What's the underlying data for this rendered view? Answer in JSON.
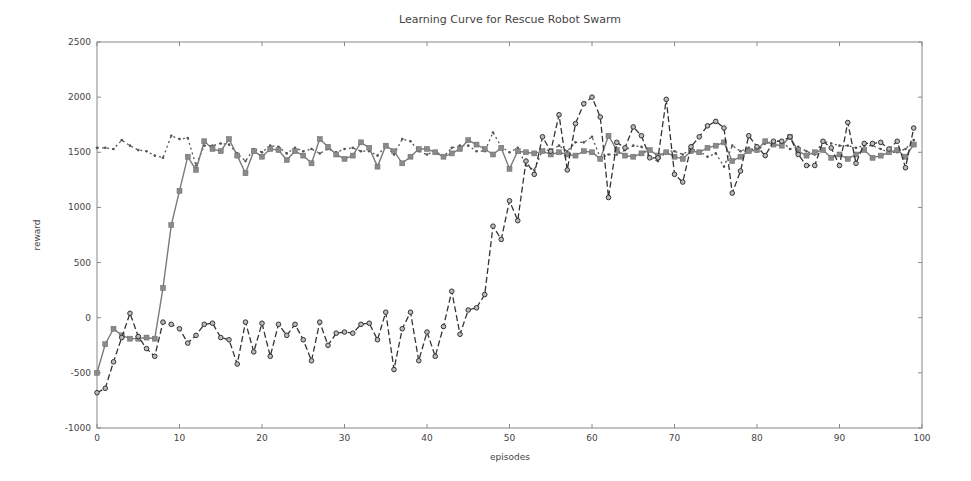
{
  "chart_data": {
    "type": "line",
    "title": "Learning Curve for Rescue Robot Swarm",
    "xlabel": "episodes",
    "ylabel": "reward",
    "xlim": [
      0,
      100
    ],
    "ylim": [
      -1000,
      2500
    ],
    "xticks": [
      0,
      10,
      20,
      30,
      40,
      50,
      60,
      70,
      80,
      90,
      100
    ],
    "yticks": [
      -1000,
      -500,
      0,
      500,
      1000,
      1500,
      2000,
      2500
    ],
    "grid": false,
    "legend": null,
    "x": [
      0,
      1,
      2,
      3,
      4,
      5,
      6,
      7,
      8,
      9,
      10,
      11,
      12,
      13,
      14,
      15,
      16,
      17,
      18,
      19,
      20,
      21,
      22,
      23,
      24,
      25,
      26,
      27,
      28,
      29,
      30,
      31,
      32,
      33,
      34,
      35,
      36,
      37,
      38,
      39,
      40,
      41,
      42,
      43,
      44,
      45,
      46,
      47,
      48,
      49,
      50,
      51,
      52,
      53,
      54,
      55,
      56,
      57,
      58,
      59,
      60,
      61,
      62,
      63,
      64,
      65,
      66,
      67,
      68,
      69,
      70,
      71,
      72,
      73,
      74,
      75,
      76,
      77,
      78,
      79,
      80,
      81,
      82,
      83,
      84,
      85,
      86,
      87,
      88,
      89,
      90,
      91,
      92,
      93,
      94,
      95,
      96,
      97,
      98,
      99
    ],
    "series": [
      {
        "name": "series-squares-solid",
        "style": "solid",
        "marker": "square",
        "color": "#7a7a7a",
        "values": [
          -500,
          -240,
          -100,
          -160,
          -190,
          -190,
          -180,
          -190,
          270,
          840,
          1150,
          1460,
          1340,
          1600,
          1530,
          1510,
          1620,
          1470,
          1310,
          1510,
          1460,
          1530,
          1520,
          1430,
          1510,
          1470,
          1400,
          1620,
          1550,
          1480,
          1440,
          1470,
          1590,
          1540,
          1370,
          1560,
          1510,
          1400,
          1460,
          1530,
          1530,
          1500,
          1460,
          1490,
          1530,
          1610,
          1570,
          1530,
          1480,
          1540,
          1350,
          1510,
          1500,
          1490,
          1510,
          1480,
          1500,
          1480,
          1470,
          1510,
          1500,
          1440,
          1650,
          1520,
          1470,
          1460,
          1490,
          1520,
          1470,
          1500,
          1460,
          1440,
          1510,
          1500,
          1540,
          1560,
          1590,
          1420,
          1460,
          1510,
          1520,
          1600,
          1570,
          1560,
          1640,
          1510,
          1470,
          1500,
          1520,
          1450,
          1480,
          1440,
          1480,
          1520,
          1450,
          1470,
          1500,
          1520,
          1460,
          1570
        ]
      },
      {
        "name": "series-circles-dashed",
        "style": "dashed",
        "marker": "circle",
        "color": "#333333",
        "values": [
          -680,
          -640,
          -400,
          -180,
          40,
          -170,
          -280,
          -350,
          -40,
          -60,
          -100,
          -230,
          -160,
          -60,
          -50,
          -180,
          -200,
          -420,
          -40,
          -310,
          -50,
          -350,
          -60,
          -160,
          -60,
          -200,
          -390,
          -40,
          -250,
          -140,
          -130,
          -140,
          -60,
          -50,
          -200,
          50,
          -470,
          -100,
          50,
          -390,
          -130,
          -350,
          -80,
          240,
          -150,
          70,
          90,
          210,
          830,
          710,
          1060,
          880,
          1420,
          1300,
          1640,
          1510,
          1840,
          1340,
          1760,
          1940,
          2000,
          1820,
          1090,
          1590,
          1540,
          1730,
          1650,
          1450,
          1450,
          1980,
          1300,
          1230,
          1550,
          1640,
          1740,
          1780,
          1720,
          1130,
          1330,
          1650,
          1550,
          1470,
          1600,
          1600,
          1640,
          1480,
          1380,
          1380,
          1600,
          1540,
          1380,
          1770,
          1400,
          1580,
          1580,
          1590,
          1530,
          1600,
          1360,
          1720
        ]
      },
      {
        "name": "series-dotted",
        "style": "dotted",
        "marker": "dot",
        "color": "#555555",
        "values": [
          1540,
          1540,
          1530,
          1610,
          1560,
          1520,
          1510,
          1470,
          1450,
          1650,
          1620,
          1630,
          1380,
          1560,
          1560,
          1580,
          1570,
          1490,
          1420,
          1530,
          1500,
          1560,
          1550,
          1490,
          1540,
          1510,
          1530,
          1490,
          1530,
          1500,
          1530,
          1540,
          1510,
          1510,
          1470,
          1560,
          1480,
          1620,
          1600,
          1510,
          1480,
          1510,
          1460,
          1540,
          1560,
          1560,
          1510,
          1510,
          1680,
          1550,
          1500,
          1540,
          1380,
          1340,
          1520,
          1520,
          1560,
          1510,
          1590,
          1590,
          1640,
          1450,
          1480,
          1480,
          1520,
          1560,
          1550,
          1450,
          1420,
          1510,
          1510,
          1480,
          1530,
          1510,
          1460,
          1490,
          1370,
          1560,
          1510,
          1540,
          1510,
          1580,
          1600,
          1600,
          1530,
          1550,
          1510,
          1480,
          1600,
          1580,
          1560,
          1560,
          1540,
          1560,
          1560,
          1530,
          1500,
          1500,
          1530,
          1610
        ]
      }
    ]
  }
}
